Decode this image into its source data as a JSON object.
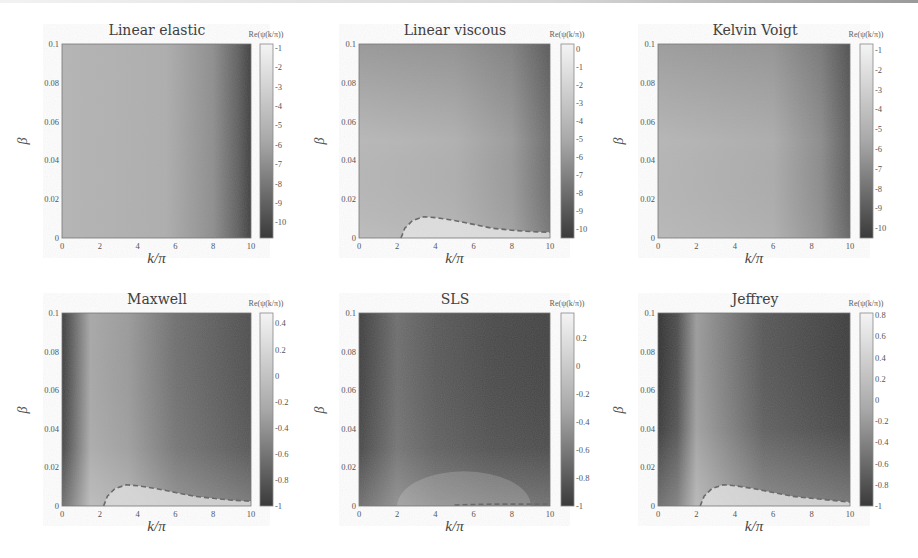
{
  "figure": {
    "colorbar_label": "Re(ψ(k/π))",
    "xlabel": "k/π",
    "ylabel": "β",
    "x_ticks": [
      "0",
      "2",
      "4",
      "6",
      "8",
      "10"
    ],
    "y_ticks": [
      "0.1",
      "0.08",
      "0.06",
      "0.04",
      "0.02",
      "0"
    ]
  },
  "chart_data": [
    {
      "type": "heatmap",
      "title": "Linear elastic",
      "xlabel": "k/π",
      "ylabel": "β",
      "xlim": [
        0,
        10
      ],
      "ylim": [
        0,
        0.1
      ],
      "x_ticks": [
        0,
        2,
        4,
        6,
        8,
        10
      ],
      "y_ticks": [
        0,
        0.02,
        0.04,
        0.06,
        0.08,
        0.1
      ],
      "colorbar": {
        "label": "Re(ψ(k/π))",
        "range": [
          -10.8,
          -0.8
        ],
        "ticks": [
          -1,
          -2,
          -3,
          -4,
          -5,
          -6,
          -7,
          -8,
          -9,
          -10
        ]
      },
      "colormap": "gray",
      "description": "Uniform light gray across most of domain, darkening toward k/π=10 (approx -10 at right edge)",
      "dashed_contour": []
    },
    {
      "type": "heatmap",
      "title": "Linear viscous",
      "xlabel": "k/π",
      "ylabel": "β",
      "xlim": [
        0,
        10
      ],
      "ylim": [
        0,
        0.1
      ],
      "x_ticks": [
        0,
        2,
        4,
        6,
        8,
        10
      ],
      "y_ticks": [
        0,
        0.02,
        0.04,
        0.06,
        0.08,
        0.1
      ],
      "colorbar": {
        "label": "Re(ψ(k/π))",
        "range": [
          -10.5,
          0.3
        ],
        "ticks": [
          0,
          -1,
          -2,
          -3,
          -4,
          -5,
          -6,
          -7,
          -8,
          -9,
          -10
        ]
      },
      "colormap": "gray",
      "description": "Light gray, darker at top-right corner; bright region near β=0 for k/π>2.2",
      "dashed_contour": [
        [
          2.2,
          0
        ],
        [
          2.4,
          0.005
        ],
        [
          2.8,
          0.009
        ],
        [
          3.4,
          0.011
        ],
        [
          4,
          0.0105
        ],
        [
          5,
          0.009
        ],
        [
          6,
          0.007
        ],
        [
          7,
          0.005
        ],
        [
          8,
          0.004
        ],
        [
          9,
          0.0033
        ],
        [
          10,
          0.003
        ]
      ]
    },
    {
      "type": "heatmap",
      "title": "Kelvin Voigt",
      "xlabel": "k/π",
      "ylabel": "β",
      "xlim": [
        0,
        10
      ],
      "ylim": [
        0,
        0.1
      ],
      "x_ticks": [
        0,
        2,
        4,
        6,
        8,
        10
      ],
      "y_ticks": [
        0,
        0.02,
        0.04,
        0.06,
        0.08,
        0.1
      ],
      "colorbar": {
        "label": "Re(ψ(k/π))",
        "range": [
          -10.5,
          -0.7
        ],
        "ticks": [
          -1,
          -2,
          -3,
          -4,
          -5,
          -6,
          -7,
          -8,
          -9,
          -10
        ]
      },
      "colormap": "gray",
      "description": "Light gray, darkening toward top-right corner",
      "dashed_contour": []
    },
    {
      "type": "heatmap",
      "title": "Maxwell",
      "xlabel": "k/π",
      "ylabel": "β",
      "xlim": [
        0,
        10
      ],
      "ylim": [
        0,
        0.1
      ],
      "x_ticks": [
        0,
        2,
        4,
        6,
        8,
        10
      ],
      "y_ticks": [
        0,
        0.02,
        0.04,
        0.06,
        0.08,
        0.1
      ],
      "colorbar": {
        "label": "Re(ψ(k/π))",
        "range": [
          -1,
          0.48
        ],
        "ticks": [
          0.4,
          0.2,
          0,
          -0.2,
          -0.4,
          -0.6,
          -0.8,
          -1
        ]
      },
      "colormap": "gray",
      "description": "Dark band at k/π<0.5, light band around k/π 1-4, darkening toward right; bright region near β=0 for k/π>2.2",
      "dashed_contour": [
        [
          2.2,
          0
        ],
        [
          2.4,
          0.005
        ],
        [
          2.8,
          0.009
        ],
        [
          3.4,
          0.011
        ],
        [
          4,
          0.0105
        ],
        [
          5,
          0.009
        ],
        [
          6,
          0.007
        ],
        [
          7,
          0.005
        ],
        [
          8,
          0.004
        ],
        [
          9,
          0.003
        ],
        [
          10,
          0.0025
        ]
      ]
    },
    {
      "type": "heatmap",
      "title": "SLS",
      "xlabel": "k/π",
      "ylabel": "β",
      "xlim": [
        0,
        10
      ],
      "ylim": [
        0,
        0.1
      ],
      "x_ticks": [
        0,
        2,
        4,
        6,
        8,
        10
      ],
      "y_ticks": [
        0,
        0.02,
        0.04,
        0.06,
        0.08,
        0.1
      ],
      "colorbar": {
        "label": "Re(ψ(k/π))",
        "range": [
          -1,
          0.38
        ],
        "ticks": [
          0.2,
          0,
          -0.2,
          -0.4,
          -0.6,
          -0.8,
          -1
        ]
      },
      "colormap": "gray",
      "description": "Mostly dark, medium band around k/π 1-4, lighter near β=0 for k/π 2-8",
      "dashed_contour": [
        [
          5,
          0.0005
        ],
        [
          6,
          0.0008
        ],
        [
          7,
          0.001
        ],
        [
          8,
          0.001
        ],
        [
          9,
          0.001
        ],
        [
          10,
          0.001
        ]
      ]
    },
    {
      "type": "heatmap",
      "title": "Jeffrey",
      "xlabel": "k/π",
      "ylabel": "β",
      "xlim": [
        0,
        10
      ],
      "ylim": [
        0,
        0.1
      ],
      "x_ticks": [
        0,
        2,
        4,
        6,
        8,
        10
      ],
      "y_ticks": [
        0,
        0.02,
        0.04,
        0.06,
        0.08,
        0.1
      ],
      "colorbar": {
        "label": "Re(ψ(k/π))",
        "range": [
          -1,
          0.82
        ],
        "ticks": [
          0.8,
          0.6,
          0.4,
          0.2,
          0,
          -0.2,
          -0.4,
          -0.6,
          -0.8,
          -1
        ]
      },
      "colormap": "gray",
      "description": "Dark band k/π<1, light band around k/π 1-3, dark toward right; bright region near β=0 for k/π>2.2",
      "dashed_contour": [
        [
          2.2,
          0
        ],
        [
          2.4,
          0.005
        ],
        [
          2.8,
          0.009
        ],
        [
          3.4,
          0.011
        ],
        [
          4,
          0.0105
        ],
        [
          5,
          0.009
        ],
        [
          6,
          0.007
        ],
        [
          7,
          0.005
        ],
        [
          8,
          0.004
        ],
        [
          9,
          0.003
        ],
        [
          10,
          0.002
        ]
      ]
    }
  ]
}
